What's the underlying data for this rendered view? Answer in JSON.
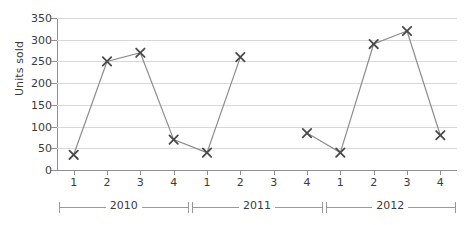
{
  "chart_data": {
    "type": "line",
    "title": "",
    "xlabel": "",
    "ylabel": "Units sold",
    "ylim": [
      0,
      350
    ],
    "ytick_step": 50,
    "yticks": [
      0,
      50,
      100,
      150,
      200,
      250,
      300,
      350
    ],
    "grid": true,
    "legend": "none",
    "marker": "x",
    "categories": [
      "2010 Q1",
      "2010 Q2",
      "2010 Q3",
      "2010 Q4",
      "2011 Q1",
      "2011 Q2",
      "2011 Q3",
      "2011 Q4",
      "2012 Q1",
      "2012 Q2",
      "2012 Q3",
      "2012 Q4"
    ],
    "x_tick_labels": [
      "1",
      "2",
      "3",
      "4",
      "1",
      "2",
      "3",
      "4",
      "1",
      "2",
      "3",
      "4"
    ],
    "values": [
      35,
      250,
      270,
      70,
      40,
      260,
      null,
      85,
      40,
      290,
      320,
      80
    ],
    "series": [
      {
        "name": "Units sold",
        "values": [
          35,
          250,
          270,
          70,
          40,
          260,
          null,
          85,
          40,
          290,
          320,
          80
        ]
      }
    ],
    "groups": [
      {
        "label": "2010",
        "start_index": 0,
        "end_index": 3
      },
      {
        "label": "2011",
        "start_index": 4,
        "end_index": 7
      },
      {
        "label": "2012",
        "start_index": 8,
        "end_index": 11
      }
    ]
  },
  "colors": {
    "line": "#8c8c8c",
    "marker": "#4a4a4a",
    "grid": "#d8d8d8",
    "axis": "#8f8f8f",
    "text": "#3b3b3b",
    "background": "#ffffff"
  }
}
